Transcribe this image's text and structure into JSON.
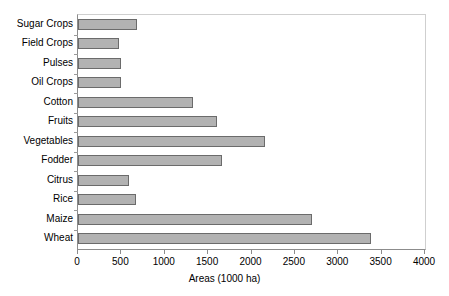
{
  "chart_data": {
    "type": "bar",
    "orientation": "horizontal",
    "title": "",
    "xlabel": "Areas (1000 ha)",
    "ylabel": "",
    "xlim": [
      0,
      4000
    ],
    "xticks": [
      0,
      500,
      1000,
      1500,
      2000,
      2500,
      3000,
      3500,
      4000
    ],
    "xtick_labels": [
      "0",
      "500",
      "1000",
      "1500",
      "2000",
      "2500",
      "3000",
      "3500",
      "4000"
    ],
    "grid": false,
    "legend": null,
    "bar_fill_color": "#b2b2b2",
    "bar_edge_color": "#6b6b6b",
    "axis_color": "#8c8c8c",
    "categories": [
      "Sugar Crops",
      "Field Crops",
      "Pulses",
      "Oil Crops",
      "Cotton",
      "Fruits",
      "Vegetables",
      "Fodder",
      "Citrus",
      "Rice",
      "Maize",
      "Wheat"
    ],
    "values": [
      680,
      470,
      500,
      490,
      1320,
      1600,
      2160,
      1660,
      590,
      670,
      2700,
      3380
    ],
    "series": [
      {
        "name": "Areas",
        "values": [
          680,
          470,
          500,
          490,
          1320,
          1600,
          2160,
          1660,
          590,
          670,
          2700,
          3380
        ]
      }
    ]
  }
}
